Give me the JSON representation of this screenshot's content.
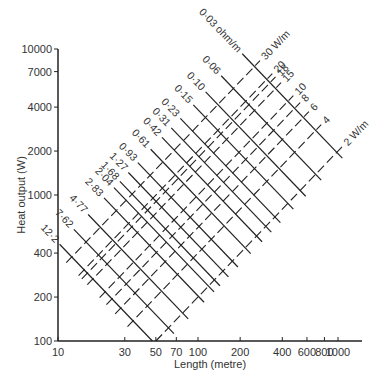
{
  "chart_data": {
    "type": "line",
    "title": "",
    "xlabel": "Length (metre)",
    "ylabel": "Heat output (W)",
    "x_scale": "log",
    "y_scale": "log",
    "xlim": [
      10,
      1000
    ],
    "ylim": [
      100,
      10000
    ],
    "x_ticks": [
      10,
      30,
      50,
      70,
      100,
      200,
      400,
      600,
      800,
      1000
    ],
    "x_tick_labels": [
      "10",
      "30",
      "50",
      "70",
      "100",
      "200",
      "400",
      "600",
      "800",
      "1000"
    ],
    "y_ticks": [
      100,
      200,
      400,
      1000,
      2000,
      4000,
      7000,
      10000
    ],
    "y_tick_labels": [
      "100",
      "200",
      "400",
      "1000",
      "2000",
      "4000",
      "7000",
      "10000"
    ],
    "grid": false,
    "legend": null,
    "supply_voltage_product": 57600,
    "resistance_series": {
      "style": "solid",
      "unit_suffix": " ohm/m",
      "description": "Lines of constant cable resistance (ohm/m)",
      "values": [
        0.03,
        0.06,
        0.1,
        0.15,
        0.23,
        0.31,
        0.42,
        0.61,
        0.93,
        1.27,
        1.68,
        2.04,
        2.83,
        4.77,
        7.62,
        12.2
      ],
      "labels": [
        "0·03 ohm/m",
        "0·06",
        "0·10",
        "0·15",
        "0·23",
        "0·31",
        "0·42",
        "0·61",
        "0·93",
        "1·27",
        "1·68",
        "2·04",
        "2·83",
        "4·77",
        "7·62",
        "12·2"
      ]
    },
    "loading_series": {
      "style": "dashed",
      "unit_suffix": " W/m",
      "description": "Lines of constant heat loading (W/m)",
      "values": [
        30,
        20,
        18,
        15,
        10,
        8,
        6,
        4,
        2
      ],
      "labels": [
        "30 W/m",
        "20",
        "18",
        "15",
        "10",
        "8",
        "6",
        "4",
        "2 W/m"
      ]
    }
  },
  "axes": {
    "x_label": "Length (metre)",
    "y_label": "Heat output (W)"
  },
  "colors": {
    "line": "#222222",
    "text": "#333333",
    "background": "#ffffff"
  }
}
